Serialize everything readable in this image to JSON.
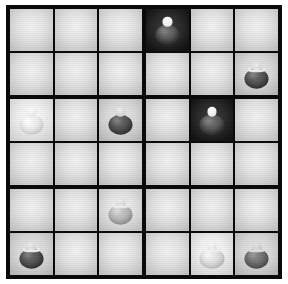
{
  "board": {
    "title": "ball-sudoku-grid",
    "rows": 6,
    "columns": 6,
    "block_rows": 2,
    "block_columns": 3,
    "frame_color": "#0a0a0a",
    "cell_light_color": "#e3e3e3",
    "cell_dark_color": "#1a1a1a",
    "separator_color": "#ffffff",
    "blocks": [
      {
        "name": "block-1",
        "cells": [
          {
            "name": "cell-r1c1",
            "row": 1,
            "col": 1,
            "shade": "light",
            "piece": null
          },
          {
            "name": "cell-r1c2",
            "row": 1,
            "col": 2,
            "shade": "light",
            "piece": null
          },
          {
            "name": "cell-r1c3",
            "row": 1,
            "col": 3,
            "shade": "light",
            "piece": null
          },
          {
            "name": "cell-r2c1",
            "row": 2,
            "col": 1,
            "shade": "light",
            "piece": null
          },
          {
            "name": "cell-r2c2",
            "row": 2,
            "col": 2,
            "shade": "light",
            "piece": null
          },
          {
            "name": "cell-r2c3",
            "row": 2,
            "col": 3,
            "shade": "light",
            "piece": null
          }
        ]
      },
      {
        "name": "block-2",
        "cells": [
          {
            "name": "cell-r1c4",
            "row": 1,
            "col": 4,
            "shade": "dark",
            "piece": "bright-ball"
          },
          {
            "name": "cell-r1c5",
            "row": 1,
            "col": 5,
            "shade": "light",
            "piece": null
          },
          {
            "name": "cell-r1c6",
            "row": 1,
            "col": 6,
            "shade": "light",
            "piece": null
          },
          {
            "name": "cell-r2c4",
            "row": 2,
            "col": 4,
            "shade": "light",
            "piece": null
          },
          {
            "name": "cell-r2c5",
            "row": 2,
            "col": 5,
            "shade": "light",
            "piece": null
          },
          {
            "name": "cell-r2c6",
            "row": 2,
            "col": 6,
            "shade": "middark",
            "piece": "dark-ball-bow"
          }
        ]
      },
      {
        "name": "block-3",
        "cells": [
          {
            "name": "cell-r3c1",
            "row": 3,
            "col": 1,
            "shade": "midlight",
            "piece": "white-ball"
          },
          {
            "name": "cell-r3c2",
            "row": 3,
            "col": 2,
            "shade": "light",
            "piece": null
          },
          {
            "name": "cell-r3c3",
            "row": 3,
            "col": 3,
            "shade": "middark",
            "piece": "dark-ball"
          },
          {
            "name": "cell-r4c1",
            "row": 4,
            "col": 1,
            "shade": "light",
            "piece": null
          },
          {
            "name": "cell-r4c2",
            "row": 4,
            "col": 2,
            "shade": "light",
            "piece": null
          },
          {
            "name": "cell-r4c3",
            "row": 4,
            "col": 3,
            "shade": "light",
            "piece": null
          }
        ]
      },
      {
        "name": "block-4",
        "cells": [
          {
            "name": "cell-r3c4",
            "row": 3,
            "col": 4,
            "shade": "light",
            "piece": null
          },
          {
            "name": "cell-r3c5",
            "row": 3,
            "col": 5,
            "shade": "dark",
            "piece": "bright-ball"
          },
          {
            "name": "cell-r3c6",
            "row": 3,
            "col": 6,
            "shade": "light",
            "piece": null
          },
          {
            "name": "cell-r4c4",
            "row": 4,
            "col": 4,
            "shade": "light",
            "piece": null
          },
          {
            "name": "cell-r4c5",
            "row": 4,
            "col": 5,
            "shade": "light",
            "piece": null
          },
          {
            "name": "cell-r4c6",
            "row": 4,
            "col": 6,
            "shade": "light",
            "piece": null
          }
        ]
      },
      {
        "name": "block-5",
        "cells": [
          {
            "name": "cell-r5c1",
            "row": 5,
            "col": 1,
            "shade": "light",
            "piece": null
          },
          {
            "name": "cell-r5c2",
            "row": 5,
            "col": 2,
            "shade": "light",
            "piece": null
          },
          {
            "name": "cell-r5c3",
            "row": 5,
            "col": 3,
            "shade": "light",
            "piece": "grey-ball-bow"
          },
          {
            "name": "cell-r6c1",
            "row": 6,
            "col": 1,
            "shade": "middark",
            "piece": "dark-ball-bow"
          },
          {
            "name": "cell-r6c2",
            "row": 6,
            "col": 2,
            "shade": "light",
            "piece": null
          },
          {
            "name": "cell-r6c3",
            "row": 6,
            "col": 3,
            "shade": "light",
            "piece": null
          }
        ]
      },
      {
        "name": "block-6",
        "cells": [
          {
            "name": "cell-r5c4",
            "row": 5,
            "col": 4,
            "shade": "light",
            "piece": null
          },
          {
            "name": "cell-r5c5",
            "row": 5,
            "col": 5,
            "shade": "light",
            "piece": null
          },
          {
            "name": "cell-r5c6",
            "row": 5,
            "col": 6,
            "shade": "light",
            "piece": null
          },
          {
            "name": "cell-r6c4",
            "row": 6,
            "col": 4,
            "shade": "light",
            "piece": null
          },
          {
            "name": "cell-r6c5",
            "row": 6,
            "col": 5,
            "shade": "midlight",
            "piece": "white-ball-bow"
          },
          {
            "name": "cell-r6c6",
            "row": 6,
            "col": 6,
            "shade": "middark",
            "piece": "darkcell-ball-bow"
          }
        ]
      }
    ],
    "piece_styles": {
      "white-ball": {
        "class": "p-white round-neck no-bow",
        "label": "white ball"
      },
      "white-ball-bow": {
        "class": "p-lightgrey",
        "label": "white ball with bow"
      },
      "grey-ball-bow": {
        "class": "p-grey",
        "label": "grey ball with bow"
      },
      "dark-ball": {
        "class": "p-dark round-neck no-bow",
        "label": "dark ball"
      },
      "dark-ball-bow": {
        "class": "p-dark",
        "label": "dark ball with bow"
      },
      "bright-ball": {
        "class": "p-brightball round-neck no-bow",
        "label": "bright ball on dark cell"
      },
      "darkcell-ball-bow": {
        "class": "p-darkcell-ball",
        "label": "ball with bow on shaded cell"
      }
    }
  }
}
